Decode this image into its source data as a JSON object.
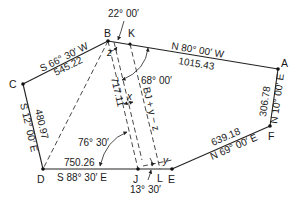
{
  "figure": {
    "type": "survey-traverse-diagram",
    "points": [
      {
        "id": "A",
        "label": "A"
      },
      {
        "id": "B",
        "label": "B"
      },
      {
        "id": "C",
        "label": "C"
      },
      {
        "id": "D",
        "label": "D"
      },
      {
        "id": "E",
        "label": "E"
      },
      {
        "id": "F",
        "label": "F"
      },
      {
        "id": "J",
        "label": "J"
      },
      {
        "id": "K",
        "label": "K"
      },
      {
        "id": "L",
        "label": "L"
      }
    ],
    "courses": [
      {
        "from": "A",
        "to": "B",
        "bearing": "N 80° 00′ W",
        "distance": "1015.43"
      },
      {
        "from": "B",
        "to": "C",
        "bearing": "S 66° 30′ W",
        "distance": "545.22"
      },
      {
        "from": "C",
        "to": "D",
        "bearing": "S 12° 00′ E",
        "distance": "480.97"
      },
      {
        "from": "D",
        "to": "E",
        "bearing": "S 88° 30′ E",
        "distance": "750.26"
      },
      {
        "from": "E",
        "to": "F",
        "bearing": "N 69° 00′ E",
        "distance": "639.18"
      },
      {
        "from": "F",
        "to": "A",
        "bearing": "N 10° 00′ E",
        "distance": "306.78"
      }
    ],
    "construction_lines": {
      "BJ_length": "717.11",
      "offset_label": "x",
      "KL_label": "BJ + y − z",
      "small_y": "y",
      "small_z": "z"
    },
    "angles": {
      "top": "22° 00′",
      "at_K": "68° 00′",
      "at_D_J": "76° 30′",
      "bottom": "13° 30′"
    }
  }
}
